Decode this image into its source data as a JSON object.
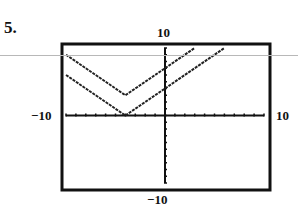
{
  "problem": {
    "number": "5."
  },
  "window": {
    "xmin_label": "−10",
    "xmax_label": "10",
    "ymin_label": "−10",
    "ymax_label": "10"
  },
  "chart_data": {
    "type": "line",
    "title": "",
    "xlabel": "",
    "ylabel": "",
    "xlim": [
      -10,
      10
    ],
    "ylim": [
      -10,
      10
    ],
    "grid": false,
    "tick_step": 1,
    "series": [
      {
        "name": "y = |x + 4| + 3",
        "x": [
          -10,
          -4,
          3
        ],
        "y": [
          9,
          3,
          10
        ]
      },
      {
        "name": "y = |x + 4|",
        "x": [
          -10,
          -4,
          6
        ],
        "y": [
          6,
          0,
          10
        ]
      }
    ],
    "annotations": [
      "Window labels: -10, 10 (x); -10, 10 (y)"
    ]
  }
}
